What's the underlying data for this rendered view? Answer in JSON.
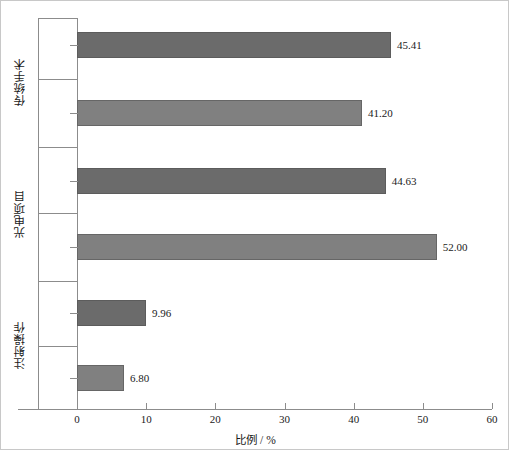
{
  "chart_data": {
    "type": "bar",
    "orientation": "horizontal",
    "title": "",
    "xlabel": "比例 / %",
    "ylabel": "",
    "xlim": [
      0,
      60
    ],
    "xticks": [
      0,
      10,
      20,
      30,
      40,
      50,
      60
    ],
    "grid": false,
    "legend": false,
    "groups": [
      {
        "label": "传统手术",
        "categories": [
          "全国均值",
          "河南省"
        ],
        "values": [
          45.41,
          41.2
        ],
        "value_labels": [
          "45.41",
          "41.20"
        ],
        "colors": [
          "#6b6b6b",
          "#808080"
        ]
      },
      {
        "label": "光电项目",
        "categories": [
          "全国均值",
          "河南省"
        ],
        "values": [
          44.63,
          52.0
        ],
        "value_labels": [
          "44.63",
          "52.00"
        ],
        "colors": [
          "#6b6b6b",
          "#808080"
        ]
      },
      {
        "label": "注射操作",
        "categories": [
          "全国均值",
          "河南省"
        ],
        "values": [
          9.96,
          6.8
        ],
        "value_labels": [
          "9.96",
          "6.80"
        ],
        "colors": [
          "#6b6b6b",
          "#808080"
        ]
      }
    ],
    "categories": [
      "传统手术 / 全国均值",
      "传统手术 / 河南省",
      "光电项目 / 全国均值",
      "光电项目 / 河南省",
      "注射操作 / 全国均值",
      "注射操作 / 河南省"
    ],
    "values": [
      45.41,
      41.2,
      44.63,
      52.0,
      9.96,
      6.8
    ]
  },
  "axis": {
    "x": {
      "label": "比例 / %",
      "ticks": [
        {
          "value": "0"
        },
        {
          "value": "10"
        },
        {
          "value": "20"
        },
        {
          "value": "30"
        },
        {
          "value": "40"
        },
        {
          "value": "50"
        },
        {
          "value": "60"
        }
      ]
    }
  },
  "colors": {
    "bar_national": "#6b6b6b",
    "bar_province": "#808080",
    "axis": "#8c8c8c",
    "frame": "#c8c8c8",
    "text": "#1a1a1a",
    "background": "#ffffff"
  },
  "bars": [
    {
      "group": "传统手术",
      "category": "全国均值",
      "value": 45.41,
      "label": "45.41"
    },
    {
      "group": "传统手术",
      "category": "河南省",
      "value": 41.2,
      "label": "41.20"
    },
    {
      "group": "光电项目",
      "category": "全国均值",
      "value": 44.63,
      "label": "44.63"
    },
    {
      "group": "光电项目",
      "category": "河南省",
      "value": 52.0,
      "label": "52.00"
    },
    {
      "group": "注射操作",
      "category": "全国均值",
      "value": 9.96,
      "label": "9.96"
    },
    {
      "group": "注射操作",
      "category": "河南省",
      "value": 6.8,
      "label": "6.80"
    }
  ],
  "groups": [
    {
      "label": "传统手术"
    },
    {
      "label": "光电项目"
    },
    {
      "label": "注射操作"
    }
  ]
}
